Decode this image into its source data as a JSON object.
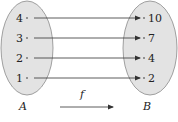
{
  "diagram": {
    "set_a": {
      "label": "A",
      "elements": [
        "4",
        "3",
        "2",
        "1"
      ]
    },
    "set_b": {
      "label": "B",
      "elements": [
        "10",
        "7",
        "4",
        "2"
      ]
    },
    "function_label": "f",
    "mappings": [
      {
        "from": "4",
        "to": "10"
      },
      {
        "from": "3",
        "to": "7"
      },
      {
        "from": "2",
        "to": "4"
      },
      {
        "from": "1",
        "to": "2"
      }
    ],
    "colors": {
      "ellipse_fill": "#e3e3e3",
      "ellipse_stroke": "#8a8a8a",
      "line": "#333333"
    }
  }
}
